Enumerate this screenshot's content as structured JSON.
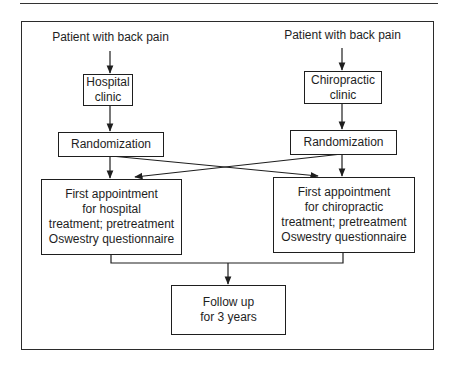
{
  "diagram": {
    "type": "flowchart",
    "left_branch": {
      "entry": "Patient with back pain",
      "clinic": "Hospital\nclinic",
      "randomization": "Randomization",
      "appointment": "First appointment\nfor hospital\ntreatment; pretreatment\nOswestry questionnaire"
    },
    "right_branch": {
      "entry": "Patient with back pain",
      "clinic": "Chiropractic\nclinic",
      "randomization": "Randomization",
      "appointment": "First appointment\nfor chiropractic\ntreatment; pretreatment\nOswestry questionnaire"
    },
    "outcome": "Follow up\nfor 3 years",
    "edges": [
      {
        "from": "left.entry",
        "to": "left.clinic"
      },
      {
        "from": "left.clinic",
        "to": "left.randomization"
      },
      {
        "from": "left.randomization",
        "to": "left.appointment"
      },
      {
        "from": "left.randomization",
        "to": "right.appointment"
      },
      {
        "from": "right.entry",
        "to": "right.clinic"
      },
      {
        "from": "right.clinic",
        "to": "right.randomization"
      },
      {
        "from": "right.randomization",
        "to": "right.appointment"
      },
      {
        "from": "right.randomization",
        "to": "left.appointment"
      },
      {
        "from": "left.appointment",
        "to": "outcome"
      },
      {
        "from": "right.appointment",
        "to": "outcome"
      }
    ]
  },
  "colors": {
    "line": "#1e1e1e",
    "background": "#ffffff"
  }
}
